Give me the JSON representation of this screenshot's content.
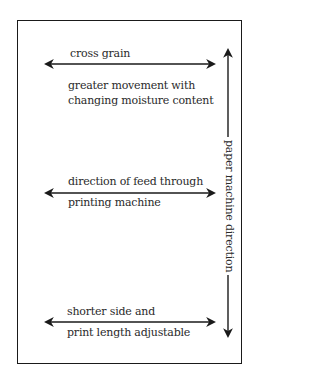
{
  "diagram": {
    "arrows": [
      {
        "id": "cross-grain",
        "direction": "horizontal",
        "label_above": "cross grain",
        "label_below_line1": "greater movement with",
        "label_below_line2": "changing moisture content"
      },
      {
        "id": "feed",
        "direction": "horizontal",
        "label_above": "direction of feed through",
        "label_below": "printing machine"
      },
      {
        "id": "shorter-side",
        "direction": "horizontal",
        "label_above": "shorter side and",
        "label_below": "print length adjustable"
      },
      {
        "id": "machine-direction",
        "direction": "vertical",
        "label": "paper machine direction"
      }
    ],
    "colors": {
      "line": "#1a1a1a",
      "text": "#2a2a2a",
      "background": "#ffffff"
    }
  }
}
